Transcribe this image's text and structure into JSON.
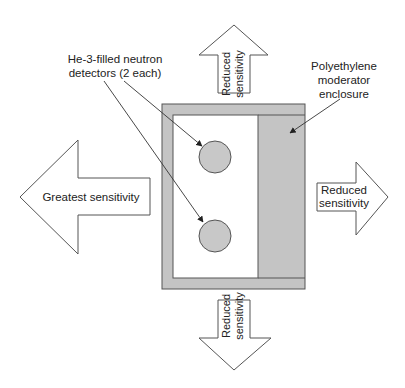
{
  "diagram": {
    "type": "neutron-detector-sensitivity-schematic",
    "colors": {
      "background": "#ffffff",
      "stroke": "#444444",
      "moderator_fill": "#c4c4c4",
      "detector_fill": "#c8c8c8",
      "arrow_fill": "#ffffff",
      "text": "#222222"
    },
    "labels": {
      "detectors": {
        "line1": "He-3-filled neutron",
        "line2": "detectors (2 each)"
      },
      "moderator": {
        "line1": "Polyethylene",
        "line2": "moderator",
        "line3": "enclosure"
      }
    },
    "arrows": {
      "left": {
        "direction": "left",
        "label": "Greatest sensitivity"
      },
      "right": {
        "direction": "right",
        "label_line1": "Reduced",
        "label_line2": "sensitivity"
      },
      "up": {
        "direction": "up",
        "label_line1": "Reduced",
        "label_line2": "sensitivity"
      },
      "down": {
        "direction": "down",
        "label_line1": "Reduced",
        "label_line2": "sensitivity"
      }
    },
    "components": {
      "enclosure": "Polyethylene moderator enclosure",
      "detectors_count": 2
    }
  }
}
